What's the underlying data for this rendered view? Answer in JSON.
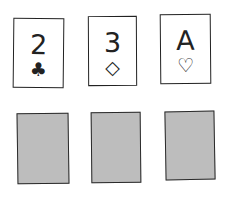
{
  "face_up_cards": [
    {
      "rank": "2",
      "suit": "clubs",
      "suit_symbol": "♣"
    },
    {
      "rank": "3",
      "suit": "diamonds",
      "suit_symbol": "◇"
    },
    {
      "rank": "A",
      "suit": "hearts",
      "suit_symbol": "♡"
    }
  ],
  "face_down_cards": [
    {
      "state": "face-down"
    },
    {
      "state": "face-down"
    },
    {
      "state": "face-down"
    }
  ],
  "colors": {
    "card_back": "#bdbdbd",
    "outline": "#222222"
  }
}
